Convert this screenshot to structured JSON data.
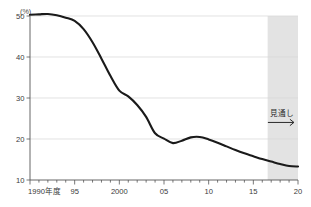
{
  "chart_data": {
    "type": "line",
    "title": "",
    "xlabel": "",
    "ylabel": "",
    "unit_label": "(%)",
    "ylim": [
      10,
      50
    ],
    "xlim": [
      1990,
      2020
    ],
    "grid": true,
    "legend": false,
    "y_ticks": [
      10,
      20,
      30,
      40,
      50
    ],
    "y_tick_labels": [
      "10",
      "20",
      "30",
      "40",
      "50"
    ],
    "x_ticks": [
      1990,
      1995,
      2000,
      2005,
      2010,
      2015,
      2020
    ],
    "x_tick_labels": [
      "1990年度",
      "95",
      "2000",
      "05",
      "10",
      "15",
      "20"
    ],
    "x_minor_tick_interval": 1,
    "annotations": [
      {
        "text": "見通し",
        "kind": "forecast-label",
        "x": 2018.2,
        "y": 25.5
      }
    ],
    "shaded_regions": [
      {
        "name": "forecast-band",
        "x_start": 2016.6,
        "x_end": 2020.0,
        "color": "#e3e3e3"
      }
    ],
    "series": [
      {
        "name": "series-1",
        "color": "#1a1a1a",
        "x": [
          1990,
          1991,
          1992,
          1993,
          1994,
          1995,
          1996,
          1997,
          1998,
          1999,
          2000,
          2001,
          2002,
          2003,
          2004,
          2005,
          2006,
          2007,
          2008,
          2009,
          2010,
          2011,
          2012,
          2013,
          2014,
          2015,
          2016,
          2017,
          2018,
          2019,
          2020
        ],
        "values": [
          50.3,
          50.4,
          50.5,
          50.2,
          49.6,
          48.8,
          46.8,
          43.6,
          39.6,
          35.4,
          31.8,
          30.4,
          28.3,
          25.4,
          21.4,
          20.1,
          19.0,
          19.6,
          20.4,
          20.5,
          19.9,
          19.1,
          18.2,
          17.3,
          16.5,
          15.8,
          15.1,
          14.5,
          13.9,
          13.4,
          13.3
        ]
      }
    ]
  },
  "axis_geometry": {
    "plot_left": 30,
    "plot_right": 298,
    "plot_top": 16,
    "plot_bottom": 180
  },
  "colors": {
    "line": "#1a1a1a",
    "grid": "#d6d6d6",
    "axis": "#555555",
    "forecast_shade": "#e3e3e3",
    "background": "#ffffff"
  }
}
